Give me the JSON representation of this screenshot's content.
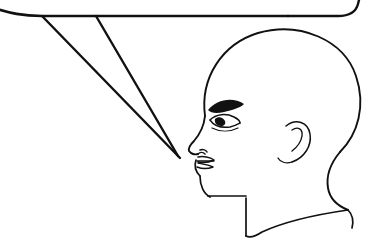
{
  "image": {
    "title": "Profile head with speech balloon",
    "type": "line-drawing",
    "background_color": "#ffffff",
    "ink_color": "#111111",
    "width": 382,
    "height": 241,
    "description": "Black ink line drawing of a bald human head in left-facing profile, with the pointed tail of a speech balloon entering from the upper left and aiming at the figure's mouth."
  },
  "subject": {
    "name": "head-profile",
    "label": "Head in profile",
    "facing": "left",
    "hair": "none",
    "parts": [
      {
        "id": "cranium",
        "label": "Cranium"
      },
      {
        "id": "forehead",
        "label": "Forehead"
      },
      {
        "id": "eyebrow",
        "label": "Eyebrow"
      },
      {
        "id": "eye",
        "label": "Eye"
      },
      {
        "id": "nose",
        "label": "Nose"
      },
      {
        "id": "nostril",
        "label": "Nostril"
      },
      {
        "id": "lips",
        "label": "Lips"
      },
      {
        "id": "chin",
        "label": "Chin"
      },
      {
        "id": "jaw",
        "label": "Jawline"
      },
      {
        "id": "ear",
        "label": "Ear"
      },
      {
        "id": "neck",
        "label": "Neck"
      },
      {
        "id": "shoulder",
        "label": "Shoulder"
      }
    ]
  },
  "balloon": {
    "name": "speech-balloon",
    "label": "Speech balloon",
    "text": "",
    "tail_direction": "lower-right",
    "tail_tip": {
      "x": 178,
      "y": 157
    },
    "corner_style": "rounded",
    "cropped": true,
    "note": "Only the lower edge and tail of the balloon are within the frame; the body of the balloon is cut off above the top of the image."
  },
  "strokes": {
    "balloon_bottom_edge": "M -6 8 C 10 13 22 16 42 16 L 288 16",
    "balloon_right_corner": "M 288 16 L 338 16 C 350 16 356 12 358 4 L 360 -4",
    "balloon_top_fragment": "M 326 -6 C 336 -9 346 -7 350 -2",
    "tail_upper": "M 42 16 L 180 158",
    "tail_lower": "M 96 16 L 178 156",
    "cranium": "M 205 116 C 200 78 222 44 258 33 C 300 21 344 40 356 76 C 366 106 358 134 340 152",
    "back_head_neck": "M 340 152 C 330 164 326 176 328 188 C 330 200 338 206 348 210",
    "shoulder_right": "M 348 210 C 352 214 354 220 352 228",
    "shoulder_line": "M 348 210 C 320 214 288 220 262 232 C 256 236 250 238 246 236",
    "neck_front": "M 246 236 L 246 198",
    "jaw_to_neck": "M 208 196 L 246 196",
    "chin_jaw": "M 200 176 C 200 186 204 194 210 197",
    "lower_lip_chin": "M 196 160 C 194 166 196 172 200 176",
    "forehead_nose": "M 205 116 C 204 126 200 134 194 141 C 190 145 188 148 189 151 C 191 154 195 155 198 154",
    "nose_under": "M 198 154 C 200 152 203 152 205 154",
    "nostril": "M 200 150 C 203 149 206 150 207 152",
    "upper_lip": "M 198 157 C 203 156 210 157 214 160 C 210 162 203 163 198 162",
    "mouth_line": "M 197 161 C 203 161 210 161 214 161",
    "lower_lip": "M 198 163 C 203 164 209 165 213 167 C 208 169 202 169 197 167",
    "eyebrow": "M 208 110 C 216 100 232 96 244 104 C 240 108 232 110 224 112 C 216 114 211 113 208 110",
    "eye_upper": "M 210 120 C 216 114 226 113 234 117 C 238 119 240 121 240 123",
    "eye_lower": "M 210 120 C 214 126 222 128 230 127 C 235 126 238 124 240 123",
    "eye_pupil": "M 215 119 C 218 116 223 117 225 121 C 226 124 224 126 221 126 C 217 126 214 123 215 119",
    "eye_crease": "M 212 128 C 220 132 230 132 238 128",
    "ear_outer": "M 286 126 C 296 118 308 122 310 134 C 312 146 304 158 292 162",
    "ear_inner": "M 292 130 C 298 126 303 129 302 136 C 301 142 296 148 292 151",
    "ear_lobe": "M 292 162 C 286 164 280 162 278 158"
  },
  "scene": {
    "elements": [
      {
        "name": "speech-balloon",
        "label": "Speech balloon outline"
      },
      {
        "name": "balloon-tail",
        "label": "Balloon pointer tail"
      },
      {
        "name": "head-profile",
        "label": "Head in profile"
      }
    ]
  }
}
